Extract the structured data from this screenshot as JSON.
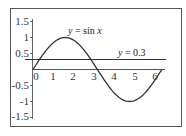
{
  "chart_data": {
    "type": "line",
    "title": "",
    "xlabel": "",
    "ylabel": "",
    "xlim": [
      0,
      6.28
    ],
    "ylim": [
      -1.5,
      1.5
    ],
    "grid": false,
    "legend": "none",
    "x_ticks": [
      "0",
      "1",
      "2",
      "3",
      "4",
      "5",
      "6"
    ],
    "y_ticks": [
      "1.5",
      "1",
      "0.5",
      "-0.5",
      "-1",
      "-1.5"
    ],
    "series": [
      {
        "name": "y = sin x",
        "function": "sin(x)",
        "x_range": [
          0,
          6.28
        ],
        "color": "#333333"
      },
      {
        "name": "y = 0.3",
        "function": "0.3",
        "x_range": [
          0,
          6.5
        ],
        "color": "#333333"
      }
    ],
    "annotations": [
      {
        "text_parts": [
          "y",
          " = sin ",
          "x"
        ],
        "x": 1.6,
        "y": 1.08
      },
      {
        "text_parts": [
          "y",
          " = 0.3"
        ],
        "x": 4.1,
        "y": 0.38
      }
    ]
  },
  "labels": {
    "sin_y": "y",
    "sin_eq": " = sin ",
    "sin_x": "x",
    "line_y": "y",
    "line_eq": " = 0.3",
    "xt0": "0",
    "xt1": "1",
    "xt2": "2",
    "xt3": "3",
    "xt4": "4",
    "xt5": "5",
    "xt6": "6",
    "yt15": "1.5",
    "yt1": "1",
    "yt05": "0.5",
    "ytm05": "-0.5",
    "ytm1": "-1",
    "ytm15": "-1.5"
  },
  "colors": {
    "frame": "#555555",
    "curve": "#333333",
    "axis": "#555555"
  }
}
